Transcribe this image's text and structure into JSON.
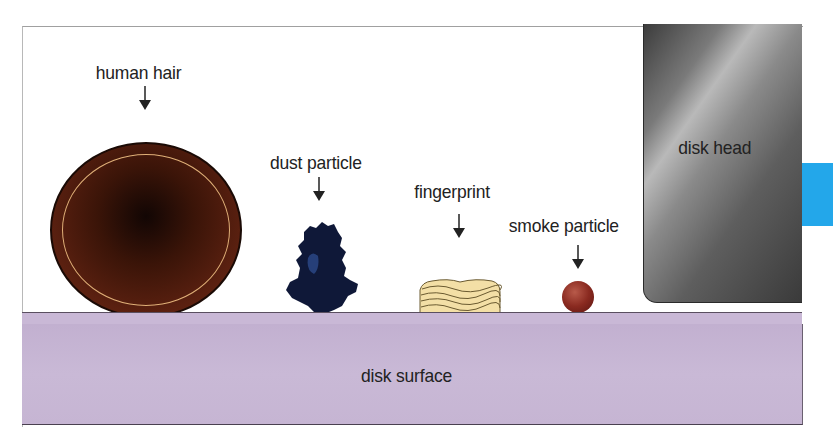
{
  "diagram": {
    "labels": {
      "human_hair": "human hair",
      "dust_particle": "dust particle",
      "fingerprint": "fingerprint",
      "smoke_particle": "smoke particle",
      "disk_head": "disk head",
      "disk_surface": "disk surface"
    },
    "colors": {
      "hair": "#5a2010",
      "hair_ring": "#e0b078",
      "dust": "#0f1a40",
      "fingerprint": "#f3dfa6",
      "smoke": "#8a2a20",
      "disk_surface": "#c6b5d3",
      "disk_head": "#6e6e6e",
      "accent_tab": "#23a7ea"
    }
  }
}
